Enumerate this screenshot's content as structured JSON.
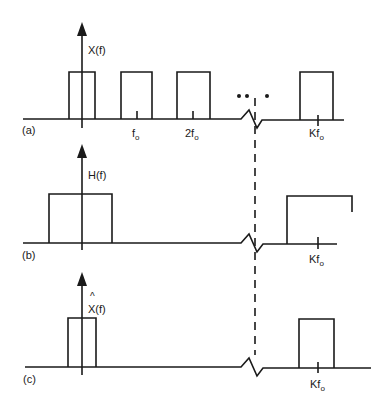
{
  "figure": {
    "panels": [
      {
        "id": "a",
        "panel_label": "(a)",
        "function_label": "X(f)",
        "ticks": [
          {
            "base": "f",
            "sub": "o"
          },
          {
            "base": "2f",
            "sub": "o"
          },
          {
            "base": "Kf",
            "sub": "o"
          }
        ],
        "ellipsis": "•• •"
      },
      {
        "id": "b",
        "panel_label": "(b)",
        "function_label": "H(f)",
        "ticks": [
          {
            "base": "Kf",
            "sub": "o"
          }
        ]
      },
      {
        "id": "c",
        "panel_label": "(c)",
        "function_label": "X(f)",
        "function_hat": "^",
        "ticks": [
          {
            "base": "Kf",
            "sub": "o"
          }
        ]
      }
    ],
    "colors": {
      "stroke": "#1a1a1a",
      "background": "#ffffff"
    }
  }
}
